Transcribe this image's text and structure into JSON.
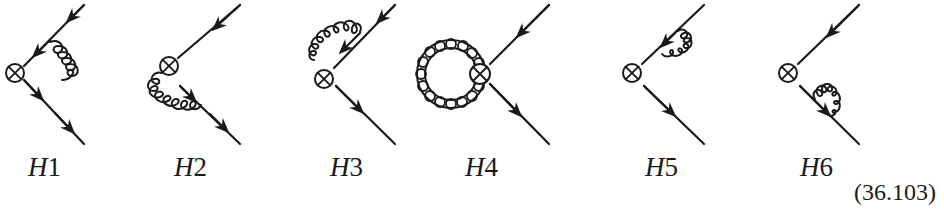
{
  "figure": {
    "diagrams": [
      {
        "id": "H1",
        "label_letter": "H",
        "label_number": "1",
        "gluon": "exchange between incoming and outgoing fermion lines"
      },
      {
        "id": "H2",
        "label_letter": "H",
        "label_number": "2",
        "gluon": "from operator vertex to outgoing fermion line"
      },
      {
        "id": "H3",
        "label_letter": "H",
        "label_number": "3",
        "gluon": "from incoming fermion line to operator vertex"
      },
      {
        "id": "H4",
        "label_letter": "H",
        "label_number": "4",
        "gluon": "closed loop at operator vertex"
      },
      {
        "id": "H5",
        "label_letter": "H",
        "label_number": "5",
        "gluon": "self-energy on incoming fermion line"
      },
      {
        "id": "H6",
        "label_letter": "H",
        "label_number": "6",
        "gluon": "self-energy on outgoing fermion line"
      }
    ],
    "equation_number": "(36.103)"
  },
  "style": {
    "ink": "#1a1a1a",
    "background": "#ffffff"
  }
}
